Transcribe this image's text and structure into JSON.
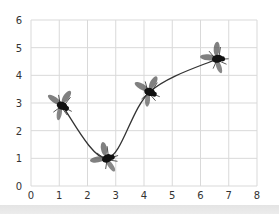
{
  "chart_data": {
    "type": "line",
    "title": "",
    "xlabel": "",
    "ylabel": "",
    "xlim": [
      0,
      8
    ],
    "ylim": [
      0,
      6
    ],
    "x_ticks": [
      "0",
      "1",
      "2",
      "3",
      "4",
      "5",
      "6",
      "7",
      "8"
    ],
    "y_ticks": [
      "0",
      "1",
      "2",
      "3",
      "4",
      "5",
      "6"
    ],
    "grid": true,
    "legend": null,
    "series": [
      {
        "name": "fly path",
        "marker": "fly-icon",
        "line_style": "smooth curve",
        "x": [
          1.1,
          2.7,
          4.2,
          6.6
        ],
        "y": [
          2.9,
          1.0,
          3.4,
          4.6
        ]
      }
    ]
  },
  "colors": {
    "grid": "#d9d9d9",
    "line": "#333333",
    "marker": "#111111",
    "background": "#ffffff",
    "bottom_band": "#e6e6e6"
  }
}
